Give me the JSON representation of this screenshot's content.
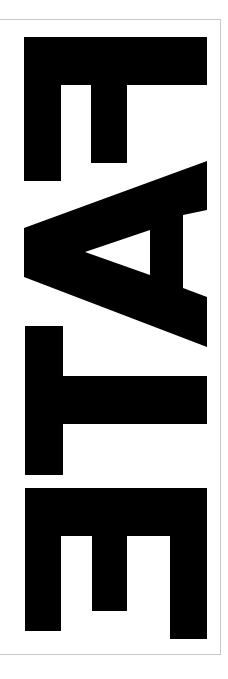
{
  "artwork": {
    "word": "FATE",
    "orientation": "rotated 90 degrees clockwise, read top to bottom",
    "letters": [
      "F",
      "A",
      "T",
      "E"
    ],
    "colors": {
      "ink": "#000000",
      "background": "#ffffff",
      "frame": "#c8c8c8"
    }
  }
}
